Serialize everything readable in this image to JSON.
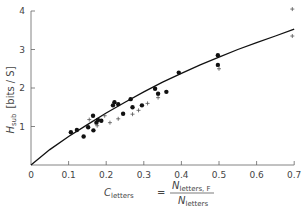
{
  "chart_data": {
    "type": "scatter",
    "title": "",
    "xlabel": "C_letters = N_letters,F / N_letters",
    "xlabel_parts": {
      "lhs": "C",
      "lhs_sub": "letters",
      "eq": "=",
      "num": "N",
      "num_sub": "letters, F",
      "den": "N",
      "den_sub": "letters"
    },
    "ylabel": "H_sub [bits / S]",
    "ylabel_parts": {
      "main": "H",
      "sub": "sub",
      "unit": "[bits / S]"
    },
    "xlim": [
      0,
      0.7
    ],
    "ylim": [
      0,
      4
    ],
    "x_ticks": [
      "0",
      "0.1",
      "0.2",
      "0.3",
      "0.4",
      "0.5",
      "0.6",
      "0.7"
    ],
    "x_tick_values": [
      0,
      0.1,
      0.2,
      0.3,
      0.4,
      0.5,
      0.6,
      0.7
    ],
    "y_ticks": [
      "1",
      "2",
      "3",
      "4"
    ],
    "y_tick_values": [
      1,
      2,
      3,
      4
    ],
    "origin_label": "0",
    "grid": false,
    "legend": null,
    "series": [
      {
        "name": "filled dots",
        "marker": "dot",
        "points": [
          [
            0.106,
            0.85
          ],
          [
            0.122,
            0.91
          ],
          [
            0.14,
            0.74
          ],
          [
            0.152,
            0.98
          ],
          [
            0.165,
            1.28
          ],
          [
            0.166,
            0.9
          ],
          [
            0.174,
            1.1
          ],
          [
            0.178,
            1.17
          ],
          [
            0.187,
            1.15
          ],
          [
            0.218,
            1.55
          ],
          [
            0.222,
            1.63
          ],
          [
            0.232,
            1.58
          ],
          [
            0.245,
            1.33
          ],
          [
            0.265,
            1.71
          ],
          [
            0.27,
            1.5
          ],
          [
            0.295,
            1.55
          ],
          [
            0.33,
            1.98
          ],
          [
            0.338,
            1.85
          ],
          [
            0.36,
            1.9
          ],
          [
            0.393,
            2.4
          ],
          [
            0.497,
            2.85
          ],
          [
            0.497,
            2.6
          ]
        ]
      },
      {
        "name": "plus markers",
        "marker": "plus",
        "points": [
          [
            0.155,
            1.18
          ],
          [
            0.176,
            1.02
          ],
          [
            0.196,
            1.28
          ],
          [
            0.21,
            1.1
          ],
          [
            0.232,
            1.2
          ],
          [
            0.27,
            1.32
          ],
          [
            0.286,
            1.42
          ],
          [
            0.31,
            1.6
          ],
          [
            0.338,
            1.75
          ],
          [
            0.5,
            2.5
          ],
          [
            0.695,
            4.05
          ],
          [
            0.695,
            3.35
          ]
        ]
      },
      {
        "name": "fitted curve",
        "type": "line",
        "points": [
          [
            0,
            0
          ],
          [
            0.05,
            0.4
          ],
          [
            0.1,
            0.74
          ],
          [
            0.15,
            1.05
          ],
          [
            0.2,
            1.35
          ],
          [
            0.25,
            1.63
          ],
          [
            0.3,
            1.9
          ],
          [
            0.35,
            2.15
          ],
          [
            0.4,
            2.38
          ],
          [
            0.45,
            2.6
          ],
          [
            0.5,
            2.8
          ],
          [
            0.55,
            3.0
          ],
          [
            0.6,
            3.18
          ],
          [
            0.65,
            3.35
          ],
          [
            0.7,
            3.53
          ]
        ]
      }
    ]
  },
  "layout": {
    "origin_px": [
      31,
      165
    ],
    "x_px_per_unit": 376,
    "y_px_per_unit": 38.5,
    "colors": {
      "axis": "#666666",
      "marker": "#111111",
      "plus": "#555555",
      "curve": "#111111",
      "text": "#444444"
    }
  }
}
